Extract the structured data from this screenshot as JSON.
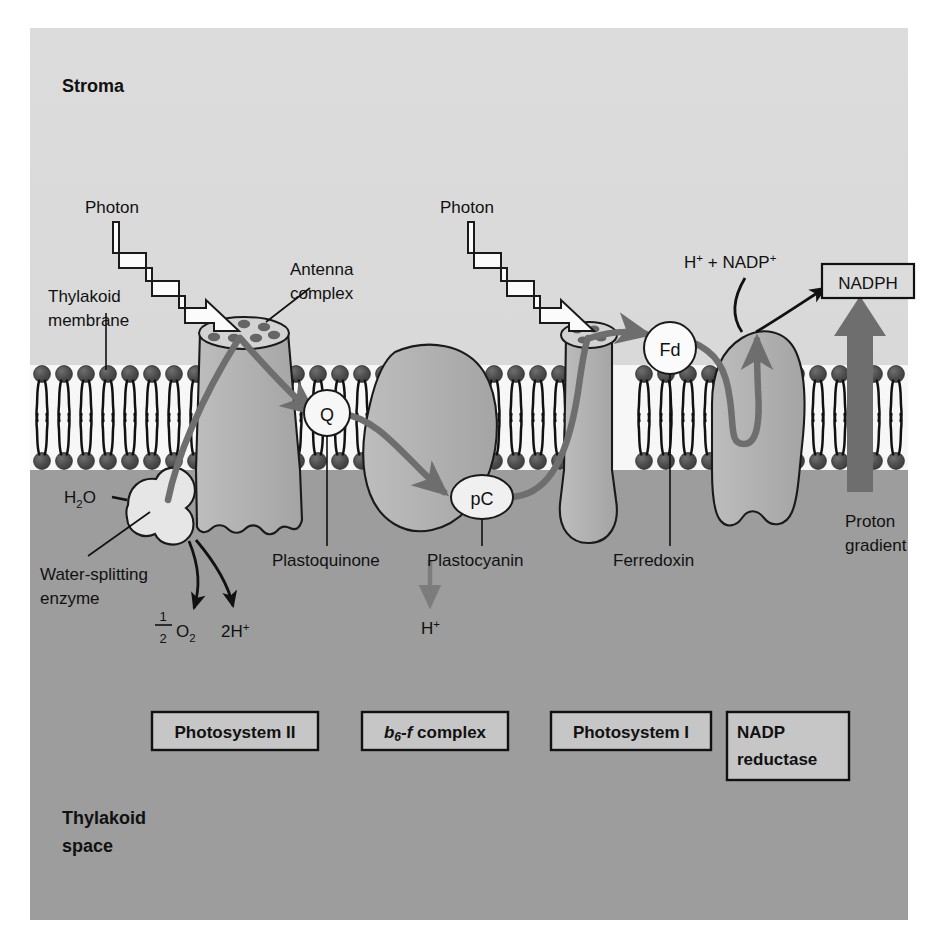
{
  "figure": {
    "background_color": "#ffffff",
    "stroma_color": "#d8d8d8",
    "lumen_color": "#9d9d9d",
    "membrane_fill": "#f8f8f8",
    "lipid_head_color": "#4a4a4a",
    "complex_fill": "#b0b0b0",
    "electron_path_color": "#6e6e6e",
    "enzyme_fill": "#e4e4e4",
    "carrier_fill": "#f5f5f5",
    "outline_color": "#1a1a1a"
  },
  "compartments": {
    "stroma_label": "Stroma",
    "thylakoid_space_line1": "Thylakoid",
    "thylakoid_space_line2": "space"
  },
  "callouts": {
    "photon_left": "Photon",
    "photon_right": "Photon",
    "thylakoid_membrane_line1": "Thylakoid",
    "thylakoid_membrane_line2": "membrane",
    "antenna_complex_line1": "Antenna",
    "antenna_complex_line2": "complex",
    "plastoquinone": "Plastoquinone",
    "plastocyanin": "Plastocyanin",
    "ferredoxin": "Ferredoxin",
    "water_splitting_line1": "Water-splitting",
    "water_splitting_line2": "enzyme",
    "proton_gradient_line1": "Proton",
    "proton_gradient_line2": "gradient"
  },
  "carriers": {
    "plastoquinone_symbol": "Q",
    "plastocyanin_symbol": "pC",
    "ferredoxin_symbol": "Fd"
  },
  "molecules": {
    "water": {
      "base": "H",
      "sub": "2",
      "tail": "O"
    },
    "oxygen": {
      "numerator": "1",
      "denominator": "2",
      "base": "O",
      "sub": "2"
    },
    "protons_released": {
      "count": "2",
      "base": "H",
      "sup": "+"
    },
    "proton_pumped": {
      "base": "H",
      "sup": "+"
    },
    "nadp_substrate": {
      "h": "H",
      "h_sup": "+",
      "plus": "+",
      "nadp": "NADP",
      "nadp_sup": "+"
    },
    "nadph_product": "NADPH"
  },
  "complex_labels": [
    {
      "id": "photosystem-ii",
      "text": "Photosystem II",
      "italic_prefix": "",
      "subscript": "",
      "suffix": ""
    },
    {
      "id": "b6f-complex",
      "text": "",
      "italic_prefix": "b",
      "subscript": "6",
      "italic_mid": "-f",
      "suffix": " complex"
    },
    {
      "id": "photosystem-i",
      "text": "Photosystem I",
      "italic_prefix": "",
      "subscript": "",
      "suffix": ""
    },
    {
      "id": "nadp-reductase",
      "text": "",
      "line1": "NADP",
      "line2": "reductase"
    }
  ]
}
